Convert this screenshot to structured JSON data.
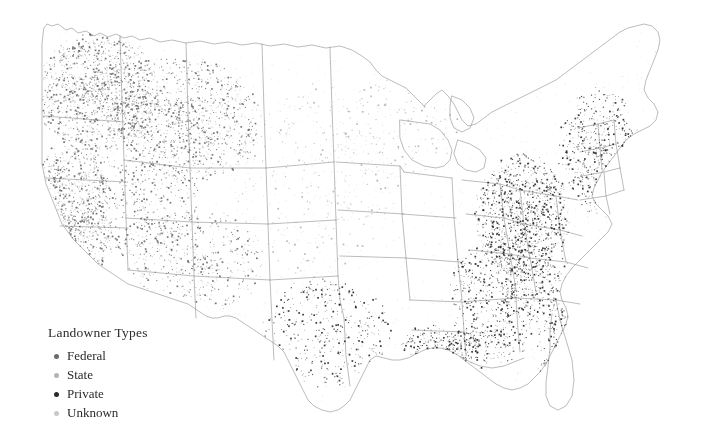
{
  "figure": {
    "background_color": "#ffffff",
    "outline_color": "#8a8a8a",
    "map_region": "United States (contiguous 48 states)",
    "projection_note": "Albers-like conic projection"
  },
  "legend": {
    "title": "Landowner Types",
    "items": [
      {
        "label": "Federal",
        "color": "#6b6b6b",
        "dot": "dot-marker"
      },
      {
        "label": "State",
        "color": "#b4b4b4",
        "dot": "dot-marker"
      },
      {
        "label": "Private",
        "color": "#2a2a2a",
        "dot": "dot-marker"
      },
      {
        "label": "Unknown",
        "color": "#c8c8c8",
        "dot": "dot-marker"
      }
    ]
  },
  "chart_data": {
    "type": "scatter",
    "title": "Landowner Types",
    "xlabel": "",
    "ylabel": "",
    "legend_position": "bottom-left",
    "grid": false,
    "series": [
      {
        "name": "Federal",
        "color": "#6b6b6b",
        "density_note": "Concentrated in the western states: Pacific Northwest, Sierra Nevada, Rocky Mountains, Great Basin, Arizona and New Mexico"
      },
      {
        "name": "State",
        "color": "#b4b4b4",
        "density_note": "Scattered lightly across the Midwest, Great Lakes and interior plains"
      },
      {
        "name": "Private",
        "color": "#2a2a2a",
        "density_note": "Dense along the Gulf Coast, Atlantic seaboard, Appalachians, Florida, Texas coast and Southeast"
      },
      {
        "name": "Unknown",
        "color": "#c8c8c8",
        "density_note": "Sparse, diffuse points across the interior"
      }
    ],
    "regions": [
      {
        "name": "Pacific Northwest",
        "density": "very high",
        "dominant": "Federal"
      },
      {
        "name": "California",
        "density": "very high",
        "dominant": "Federal"
      },
      {
        "name": "Northern Rockies",
        "density": "high",
        "dominant": "Federal"
      },
      {
        "name": "Great Basin",
        "density": "moderate",
        "dominant": "Federal"
      },
      {
        "name": "Southwest",
        "density": "moderate",
        "dominant": "Federal"
      },
      {
        "name": "Great Plains",
        "density": "low",
        "dominant": "State"
      },
      {
        "name": "Upper Midwest",
        "density": "low",
        "dominant": "State"
      },
      {
        "name": "Appalachians",
        "density": "very high",
        "dominant": "Private"
      },
      {
        "name": "Southeast",
        "density": "high",
        "dominant": "Private"
      },
      {
        "name": "Gulf Coast",
        "density": "very high",
        "dominant": "Private"
      },
      {
        "name": "Florida",
        "density": "high",
        "dominant": "Private"
      },
      {
        "name": "Northeast Coast",
        "density": "high",
        "dominant": "Private"
      },
      {
        "name": "Texas",
        "density": "moderate",
        "dominant": "Private"
      }
    ]
  }
}
